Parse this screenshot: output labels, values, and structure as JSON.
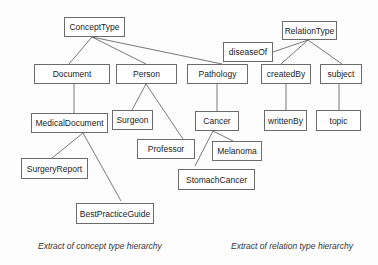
{
  "concept_hierarchy": {
    "caption": "Extract of concept type hierarchy",
    "nodes": {
      "root": "ConceptType",
      "document": "Document",
      "person": "Person",
      "pathology": "Pathology",
      "medical_document": "MedicalDocument",
      "surgeon": "Surgeon",
      "professor": "Professor",
      "cancer": "Cancer",
      "melanoma": "Melanoma",
      "stomach_cancer": "StomachCancer",
      "surgery_report": "SurgeryReport",
      "best_practice_guide": "BestPracticeGuide"
    },
    "edges": [
      [
        "ConceptType",
        "Document"
      ],
      [
        "ConceptType",
        "Person"
      ],
      [
        "ConceptType",
        "Pathology"
      ],
      [
        "Document",
        "MedicalDocument"
      ],
      [
        "MedicalDocument",
        "SurgeryReport"
      ],
      [
        "MedicalDocument",
        "BestPracticeGuide"
      ],
      [
        "Person",
        "Surgeon"
      ],
      [
        "Person",
        "Professor"
      ],
      [
        "Pathology",
        "Cancer"
      ],
      [
        "Cancer",
        "Melanoma"
      ],
      [
        "Cancer",
        "StomachCancer"
      ]
    ]
  },
  "relation_hierarchy": {
    "caption": "Extract of relation type hierarchy",
    "nodes": {
      "root": "RelationType",
      "disease_of": "diseaseOf",
      "created_by": "createdBy",
      "subject": "subject",
      "written_by": "writtenBy",
      "topic": "topic"
    },
    "edges": [
      [
        "RelationType",
        "diseaseOf"
      ],
      [
        "RelationType",
        "createdBy"
      ],
      [
        "RelationType",
        "subject"
      ],
      [
        "createdBy",
        "writtenBy"
      ],
      [
        "subject",
        "topic"
      ]
    ]
  }
}
